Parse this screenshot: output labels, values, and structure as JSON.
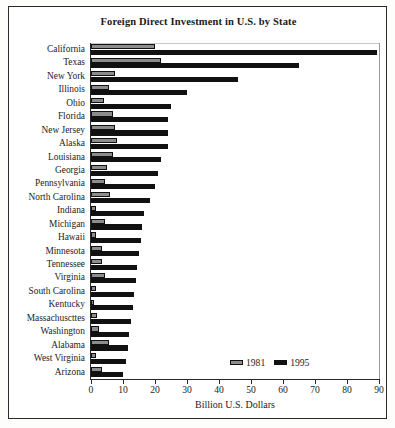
{
  "chart_data": {
    "type": "bar",
    "orientation": "horizontal",
    "title": "Foreign Direct Investment in U.S. by State",
    "xlabel": "Billion U.S. Dollars",
    "ylabel": "",
    "xlim": [
      0,
      90
    ],
    "xticks": [
      0,
      10,
      20,
      30,
      40,
      50,
      60,
      70,
      80,
      90
    ],
    "grid": false,
    "legend_position": "bottom-right",
    "categories": [
      "California",
      "Texas",
      "New York",
      "Illinois",
      "Ohio",
      "Florida",
      "New Jersey",
      "Alaska",
      "Louisiana",
      "Georgia",
      "Pennsylvania",
      "North Carolina",
      "Indiana",
      "Michigan",
      "Hawaii",
      "Minnesota",
      "Tennessee",
      "Virginia",
      "South Carolina",
      "Kentucky",
      "Massachuscttes",
      "Washington",
      "Alabama",
      "West Virginia",
      "Arizona"
    ],
    "series": [
      {
        "name": "1981",
        "color": "#8c8c8c",
        "values": [
          20.0,
          22.0,
          7.5,
          5.5,
          4.0,
          7.0,
          7.5,
          8.0,
          7.0,
          5.0,
          4.5,
          6.0,
          1.5,
          4.5,
          1.5,
          3.5,
          3.5,
          4.5,
          1.5,
          1.0,
          2.0,
          2.5,
          5.5,
          1.5,
          3.5
        ]
      },
      {
        "name": "1995",
        "color": "#111111",
        "values": [
          89.5,
          65.0,
          46.0,
          30.0,
          25.0,
          24.0,
          24.0,
          24.0,
          22.0,
          21.0,
          20.0,
          18.5,
          16.5,
          16.0,
          15.5,
          15.0,
          14.5,
          14.0,
          13.5,
          13.0,
          12.5,
          12.0,
          11.5,
          11.0,
          10.0
        ]
      }
    ]
  },
  "legend": {
    "entries": [
      {
        "label": "1981",
        "color": "#8c8c8c"
      },
      {
        "label": "1995",
        "color": "#111111"
      }
    ]
  }
}
